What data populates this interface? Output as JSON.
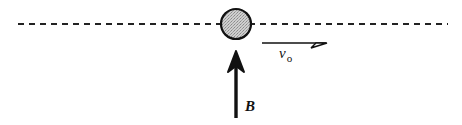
{
  "diagram": {
    "colors": {
      "stroke": "#111111",
      "particle_fill": "#bdbdbd",
      "background": "#ffffff"
    },
    "path": {
      "style": "dashed",
      "y": 24,
      "x_start": 18,
      "x_end": 448
    },
    "particle": {
      "cx": 236,
      "cy": 24,
      "r": 15
    },
    "velocity": {
      "label": "v",
      "subscript": "o",
      "x_start": 262,
      "x_end": 327,
      "y": 43
    },
    "field": {
      "label": "B",
      "x": 236,
      "y_tail": 118,
      "y_head": 52
    }
  }
}
